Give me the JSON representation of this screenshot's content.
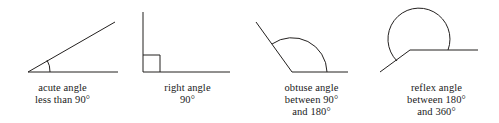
{
  "page": {
    "background_color": "#ffffff",
    "line_color": "#23201f",
    "text_color": "#1a1a1a"
  },
  "figures": [
    {
      "id": "acute",
      "name": "acute-angle",
      "caption_lines": [
        "acute angle",
        "less than 90°"
      ],
      "label": "acute angle",
      "range_text": "less than 90°",
      "angle_degrees": 30,
      "arc_marker": "single-small-arc"
    },
    {
      "id": "right",
      "name": "right-angle",
      "caption_lines": [
        "right angle",
        "90°"
      ],
      "label": "right angle",
      "range_text": "90°",
      "angle_degrees": 90,
      "arc_marker": "square-corner"
    },
    {
      "id": "obtuse",
      "name": "obtuse-angle",
      "caption_lines": [
        "obtuse angle",
        "between 90°",
        "and 180°"
      ],
      "label": "obtuse angle",
      "range_text": "between 90° and 180°",
      "angle_degrees": 125,
      "arc_marker": "large-arc"
    },
    {
      "id": "reflex",
      "name": "reflex-angle",
      "caption_lines": [
        "reflex angle",
        "between 180°",
        "and 360°"
      ],
      "label": "reflex angle",
      "range_text": "between 180° and 360°",
      "angle_degrees": 215,
      "arc_marker": "reflex-arc"
    }
  ]
}
